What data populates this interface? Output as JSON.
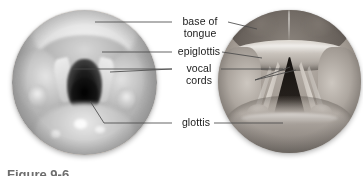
{
  "figure": {
    "background_color": "#ffffff",
    "label_color": "#1a1a1a",
    "leader_color": "#4a4a4a",
    "caption_text": "Figure 9-6",
    "caption_color": "#6d6d6d"
  },
  "panels": {
    "photograph": {
      "name": "Laryngoscopic photograph",
      "kind": "photograph",
      "shape": "circle"
    },
    "illustration": {
      "name": "Anatomical illustration",
      "kind": "illustration",
      "shape": "circle"
    }
  },
  "labels": [
    {
      "id": "base-of-tongue",
      "text": "base of\ntongue"
    },
    {
      "id": "epiglottis",
      "text": "epiglottis"
    },
    {
      "id": "vocal-cords",
      "text": "vocal\ncords"
    },
    {
      "id": "glottis",
      "text": "glottis"
    }
  ]
}
